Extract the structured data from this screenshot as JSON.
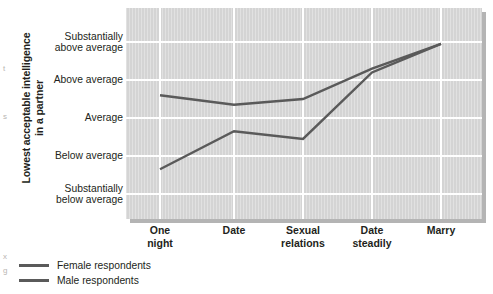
{
  "chart_data": {
    "type": "line",
    "title": "",
    "xlabel": "",
    "ylabel": "Lowest acceptable intelligence in a partner",
    "categories": [
      "One night",
      "Date",
      "Sexual relations",
      "Date steadily",
      "Marry"
    ],
    "ytick_labels": [
      "Substantially below average",
      "Below average",
      "Average",
      "Above average",
      "Substantially above average"
    ],
    "ylim": [
      1,
      5
    ],
    "grid": true,
    "legend_position": "bottom-left",
    "series": [
      {
        "name": "Female respondents",
        "values": [
          3.6,
          3.35,
          3.5,
          4.3,
          4.95
        ],
        "color": "#5a5a5a"
      },
      {
        "name": "Male respondents",
        "values": [
          1.65,
          2.65,
          2.45,
          4.2,
          4.95
        ],
        "color": "#5a5a5a"
      }
    ]
  },
  "y_axis": {
    "title_line1": "Lowest acceptable intelligence",
    "title_line2": "in a partner",
    "ticks": [
      {
        "line1": "Substantially",
        "line2": "above average",
        "value": 5
      },
      {
        "line1": "Above average",
        "line2": "",
        "value": 4
      },
      {
        "line1": "Average",
        "line2": "",
        "value": 3
      },
      {
        "line1": "Below average",
        "line2": "",
        "value": 2
      },
      {
        "line1": "Substantially",
        "line2": "below average",
        "value": 1
      }
    ]
  },
  "x_axis": {
    "ticks": [
      {
        "line1": "One",
        "line2": "night"
      },
      {
        "line1": "Date",
        "line2": ""
      },
      {
        "line1": "Sexual",
        "line2": "relations"
      },
      {
        "line1": "Date",
        "line2": "steadily"
      },
      {
        "line1": "Marry",
        "line2": ""
      }
    ]
  },
  "legend": {
    "items": [
      {
        "label": "Female respondents",
        "color": "#5a5a5a"
      },
      {
        "label": "Male respondents",
        "color": "#5a5a5a"
      }
    ]
  },
  "edge_fragments": [
    "t",
    "s",
    "x",
    "g"
  ],
  "colors": {
    "plot_background": "#d4d4d4",
    "gridline": "#ffffff",
    "line": "#5a5a5a",
    "shadow": "#b4b4b4",
    "text": "#231f20"
  }
}
